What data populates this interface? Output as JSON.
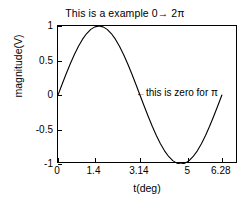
{
  "chart_data": {
    "type": "line",
    "title": "This is a example 0→ 2π",
    "xlabel": "t(deg)",
    "ylabel": "magnitude(V)",
    "xlim": [
      0,
      6.9
    ],
    "ylim": [
      -1,
      1
    ],
    "grid": false,
    "legend": null,
    "xticks": [
      0,
      1.4,
      3.14,
      5,
      6.28
    ],
    "xticklabels": [
      "0",
      "1.4",
      "3.14",
      "5",
      "6.28"
    ],
    "yticks": [
      1,
      0.5,
      0,
      -0.5,
      -1
    ],
    "yticklabels": [
      "1",
      "0.5",
      "0",
      "-0.5",
      "-1"
    ],
    "line_color": "#000000",
    "series": [
      {
        "name": "sin(t)",
        "x": [
          0,
          0.1571,
          0.3142,
          0.4712,
          0.6283,
          0.7854,
          0.9425,
          1.0996,
          1.2566,
          1.4137,
          1.5708,
          1.7279,
          1.885,
          2.042,
          2.1991,
          2.3562,
          2.5133,
          2.6704,
          2.8274,
          2.9845,
          3.1416,
          3.2987,
          3.4558,
          3.6128,
          3.7699,
          3.927,
          4.0841,
          4.2412,
          4.3982,
          4.5553,
          4.7124,
          4.8695,
          5.0265,
          5.1836,
          5.3407,
          5.4978,
          5.6549,
          5.8119,
          5.969,
          6.1261,
          6.2832
        ],
        "y": [
          0,
          0.1564,
          0.309,
          0.454,
          0.5878,
          0.7071,
          0.809,
          0.891,
          0.9511,
          0.9877,
          1,
          0.9877,
          0.9511,
          0.891,
          0.809,
          0.7071,
          0.5878,
          0.454,
          0.309,
          0.1564,
          0,
          -0.1564,
          -0.309,
          -0.454,
          -0.5878,
          -0.7071,
          -0.809,
          -0.891,
          -0.9511,
          -0.9877,
          -1,
          -0.9877,
          -0.9511,
          -0.891,
          -0.809,
          -0.7071,
          -0.5878,
          -0.454,
          -0.309,
          -0.1564,
          0
        ]
      }
    ],
    "annotations": [
      {
        "text": "←this is zero for π",
        "x": 3.14,
        "y": 0,
        "note": "arrow points left toward the zero crossing at pi"
      }
    ]
  }
}
